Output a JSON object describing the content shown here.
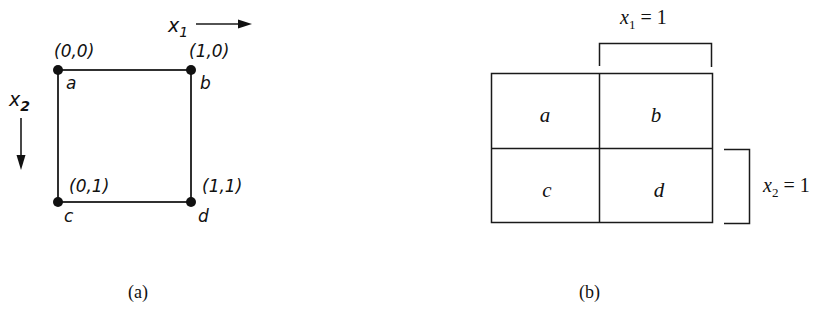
{
  "diagram_a": {
    "caption": "(a)",
    "axis_x": {
      "label": "x",
      "sub": "1"
    },
    "axis_y": {
      "label": "x",
      "sub": "2"
    },
    "vertices": [
      {
        "name": "a",
        "coord": "(0,0)"
      },
      {
        "name": "b",
        "coord": "(1,0)"
      },
      {
        "name": "c",
        "coord": "(0,1)"
      },
      {
        "name": "d",
        "coord": "(1,1)"
      }
    ]
  },
  "diagram_b": {
    "caption": "(b)",
    "cells": [
      "a",
      "b",
      "c",
      "d"
    ],
    "bracket_x1": {
      "var": "x",
      "sub": "1",
      "rest": " = 1"
    },
    "bracket_x2": {
      "var": "x",
      "sub": "2",
      "rest": " = 1"
    }
  }
}
